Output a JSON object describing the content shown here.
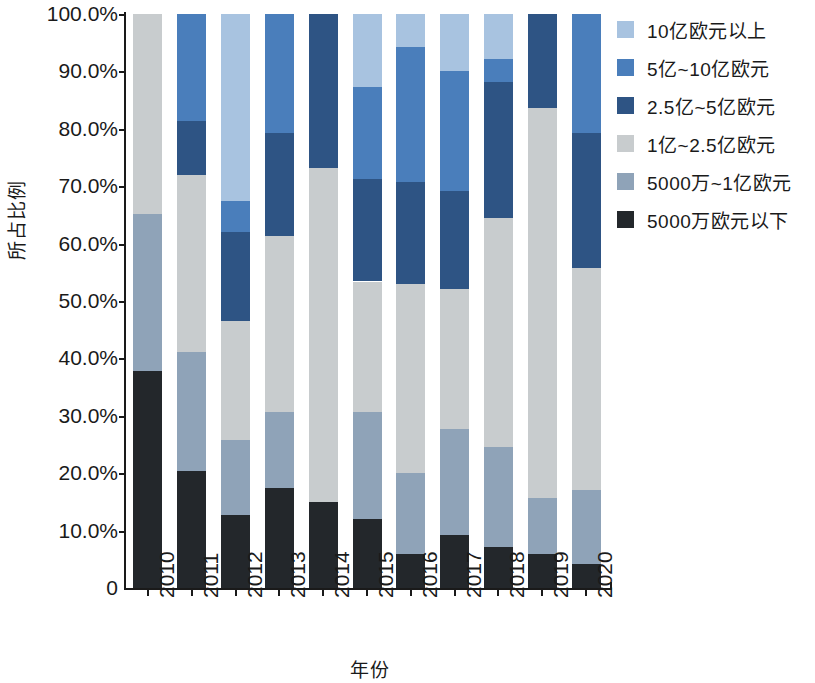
{
  "chart_data": {
    "type": "bar",
    "stacked": true,
    "stack_mode": "percent",
    "title": "",
    "xlabel": "年份",
    "ylabel": "所占比例",
    "ylim": [
      0,
      100
    ],
    "ytick_labels": [
      "0",
      "10.0%",
      "20.0%",
      "30.0%",
      "40.0%",
      "50.0%",
      "60.0%",
      "70.0%",
      "80.0%",
      "90.0%",
      "100.0%"
    ],
    "ytick_values": [
      0,
      10,
      20,
      30,
      40,
      50,
      60,
      70,
      80,
      90,
      100
    ],
    "grid": false,
    "legend_position": "right",
    "categories": [
      "2010",
      "2011",
      "2012",
      "2013",
      "2014",
      "2015",
      "2016",
      "2017",
      "2018",
      "2019",
      "2020"
    ],
    "series": [
      {
        "name": "5000万欧元以下",
        "color": "#23272b",
        "values": [
          37.8,
          20.3,
          12.7,
          17.4,
          14.9,
          12.1,
          6.0,
          9.3,
          7.1,
          6.0,
          4.2
        ]
      },
      {
        "name": "5000万~1亿欧元",
        "color": "#8fa3b8",
        "values": [
          27.4,
          20.8,
          13.1,
          13.2,
          0.0,
          18.5,
          14.0,
          18.4,
          17.4,
          9.6,
          12.9
        ]
      },
      {
        "name": "1亿~2.5亿欧元",
        "color": "#c8ccce",
        "values": [
          34.8,
          30.8,
          20.8,
          30.8,
          58.3,
          22.8,
          32.9,
          24.4,
          39.9,
          68.1,
          38.7
        ]
      },
      {
        "name": "2.5亿~5亿欧元",
        "color": "#2e5484",
        "values": [
          0.0,
          9.5,
          15.4,
          17.9,
          26.8,
          17.8,
          17.8,
          17.0,
          23.7,
          16.3,
          23.4
        ]
      },
      {
        "name": "5亿~10亿欧元",
        "color": "#4a7ebb",
        "values": [
          0.0,
          18.6,
          5.4,
          20.7,
          0.0,
          16.1,
          23.6,
          21.0,
          4.1,
          0.0,
          20.8
        ]
      },
      {
        "name": "10亿欧元以上",
        "color": "#a8c3e0",
        "values": [
          0.0,
          0.0,
          32.6,
          0.0,
          0.0,
          12.7,
          5.7,
          9.9,
          7.8,
          0.0,
          0.0
        ]
      }
    ]
  },
  "legend": {
    "items": [
      {
        "label": "10亿欧元以上",
        "color": "#a8c3e0"
      },
      {
        "label": "5亿~10亿欧元",
        "color": "#4a7ebb"
      },
      {
        "label": "2.5亿~5亿欧元",
        "color": "#2e5484"
      },
      {
        "label": "1亿~2.5亿欧元",
        "color": "#c8ccce"
      },
      {
        "label": "5000万~1亿欧元",
        "color": "#8fa3b8"
      },
      {
        "label": "5000万欧元以下",
        "color": "#23272b"
      }
    ]
  }
}
